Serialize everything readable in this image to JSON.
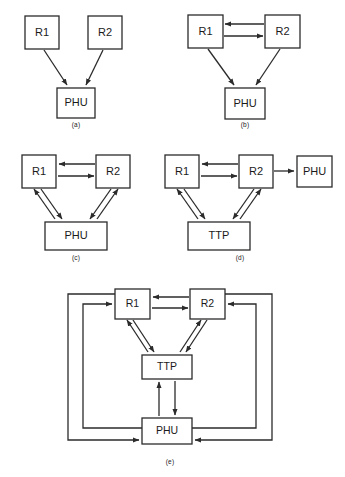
{
  "figure": {
    "stroke_color": "#2b2b2b",
    "box_fill": "#ffffff",
    "background": "#ffffff"
  },
  "panels": [
    {
      "id": "a",
      "caption": "(a)",
      "nodes": [
        {
          "name": "R1",
          "label": "R1"
        },
        {
          "name": "R2",
          "label": "R2"
        },
        {
          "name": "PHU",
          "label": "PHU"
        }
      ],
      "edges": [
        {
          "from": "R1",
          "to": "PHU",
          "direction": "one-way"
        },
        {
          "from": "R2",
          "to": "PHU",
          "direction": "one-way"
        }
      ]
    },
    {
      "id": "b",
      "caption": "(b)",
      "nodes": [
        {
          "name": "R1",
          "label": "R1"
        },
        {
          "name": "R2",
          "label": "R2"
        },
        {
          "name": "PHU",
          "label": "PHU"
        }
      ],
      "edges": [
        {
          "from": "R1",
          "to": "R2",
          "direction": "two-way"
        },
        {
          "from": "R1",
          "to": "PHU",
          "direction": "one-way"
        },
        {
          "from": "R2",
          "to": "PHU",
          "direction": "one-way"
        }
      ]
    },
    {
      "id": "c",
      "caption": "(c)",
      "nodes": [
        {
          "name": "R1",
          "label": "R1"
        },
        {
          "name": "R2",
          "label": "R2"
        },
        {
          "name": "PHU",
          "label": "PHU"
        }
      ],
      "edges": [
        {
          "from": "R1",
          "to": "R2",
          "direction": "two-way"
        },
        {
          "from": "R1",
          "to": "PHU",
          "direction": "two-way"
        },
        {
          "from": "R2",
          "to": "PHU",
          "direction": "two-way"
        }
      ]
    },
    {
      "id": "d",
      "caption": "(d)",
      "nodes": [
        {
          "name": "R1",
          "label": "R1"
        },
        {
          "name": "R2",
          "label": "R2"
        },
        {
          "name": "TTP",
          "label": "TTP"
        },
        {
          "name": "PHU",
          "label": "PHU"
        }
      ],
      "edges": [
        {
          "from": "R1",
          "to": "R2",
          "direction": "two-way"
        },
        {
          "from": "R2",
          "to": "PHU",
          "direction": "one-way"
        },
        {
          "from": "R1",
          "to": "TTP",
          "direction": "two-way"
        },
        {
          "from": "R2",
          "to": "TTP",
          "direction": "two-way"
        }
      ]
    },
    {
      "id": "e",
      "caption": "(e)",
      "nodes": [
        {
          "name": "R1",
          "label": "R1"
        },
        {
          "name": "R2",
          "label": "R2"
        },
        {
          "name": "TTP",
          "label": "TTP"
        },
        {
          "name": "PHU",
          "label": "PHU"
        }
      ],
      "edges": [
        {
          "from": "R1",
          "to": "R2",
          "direction": "two-way"
        },
        {
          "from": "R1",
          "to": "TTP",
          "direction": "two-way"
        },
        {
          "from": "R2",
          "to": "TTP",
          "direction": "two-way"
        },
        {
          "from": "TTP",
          "to": "PHU",
          "direction": "two-way"
        },
        {
          "from": "PHU",
          "to": "R1",
          "direction": "one-way",
          "route": "outer-left"
        },
        {
          "from": "R1",
          "to": "PHU",
          "direction": "one-way",
          "route": "outer-left"
        },
        {
          "from": "PHU",
          "to": "R2",
          "direction": "one-way",
          "route": "outer-right"
        },
        {
          "from": "R2",
          "to": "PHU",
          "direction": "one-way",
          "route": "outer-right"
        }
      ]
    }
  ]
}
